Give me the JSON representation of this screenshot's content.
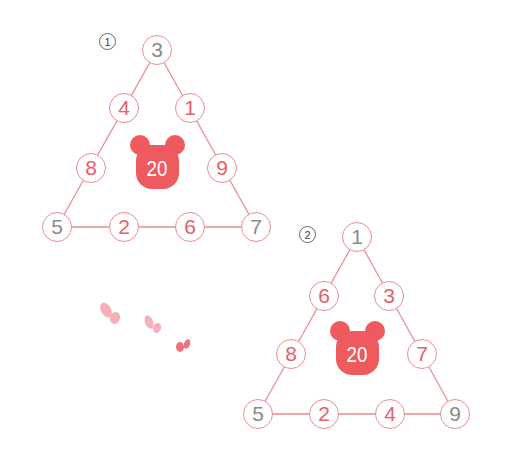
{
  "colors": {
    "line": "#ec8c95",
    "given_number": "#8a8a86",
    "answer_number": "#e8606a",
    "bear": "#ee5a5e",
    "bear_text": "#ffffff"
  },
  "puzzles": [
    {
      "label": "1",
      "target_sum": "20",
      "top": "3",
      "left_side": [
        "4",
        "8"
      ],
      "right_side": [
        "1",
        "9"
      ],
      "bottom_left": "5",
      "bottom": [
        "2",
        "6"
      ],
      "bottom_right": "7"
    },
    {
      "label": "2",
      "target_sum": "20",
      "top": "1",
      "left_side": [
        "6",
        "8"
      ],
      "right_side": [
        "3",
        "7"
      ],
      "bottom_left": "5",
      "bottom": [
        "2",
        "4"
      ],
      "bottom_right": "9"
    }
  ],
  "decorations": [
    "butterfly",
    "butterfly",
    "butterfly"
  ]
}
